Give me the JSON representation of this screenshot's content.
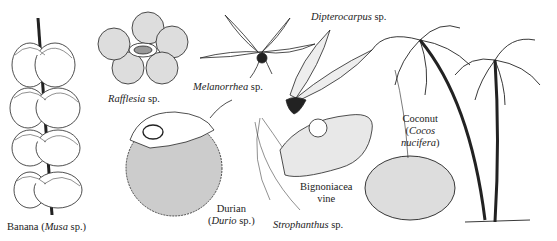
{
  "figure": {
    "labels": {
      "banana": {
        "common": "Banana",
        "genus": "Musa",
        "suffix": "sp."
      },
      "rafflesia": {
        "genus": "Rafflesia",
        "suffix": "sp."
      },
      "melanorrhea": {
        "genus": "Melanorrhea",
        "suffix": "sp."
      },
      "dipterocarpus": {
        "genus": "Dipterocarpus",
        "suffix": "sp."
      },
      "durian": {
        "common": "Durian",
        "genus": "Durio",
        "suffix": "sp."
      },
      "bignoniacea": {
        "line1": "Bignoniacea",
        "line2": "vine"
      },
      "strophanthus": {
        "genus": "Strophanthus",
        "suffix": "sp."
      },
      "coconut": {
        "common": "Coconut",
        "genus": "Cocos",
        "species": "nucifera"
      }
    }
  }
}
